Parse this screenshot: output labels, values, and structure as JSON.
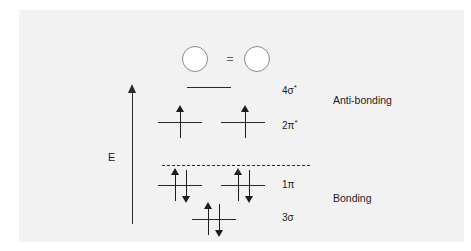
{
  "figure": {
    "background_color": "#f2f2f2",
    "page_color": "#ffffff",
    "line_color": "#2a2a2a",
    "circle_stroke_color": "#8a8a8a"
  },
  "header": {
    "equals_symbol": "=",
    "circle_left_name": "atomic-orbital-left",
    "circle_right_name": "atomic-orbital-right"
  },
  "axis": {
    "label": "E",
    "direction": "up",
    "meaning": "energy increasing upward"
  },
  "regions": [
    {
      "label": "Anti-bonding",
      "x": 333,
      "y": 94
    },
    {
      "label": "Bonding",
      "x": 333,
      "y": 192
    }
  ],
  "separator": {
    "style": "dashed",
    "meaning": "bonding / anti-bonding divide"
  },
  "chart_data": {
    "type": "diagram",
    "ylabel": "E",
    "levels": [
      {
        "label_base": "4",
        "label_greek": "σ",
        "label_star": "*",
        "label": "4σ*",
        "region": "anti-bonding",
        "electrons": 0,
        "degeneracy": 1,
        "y": 87,
        "lines": [
          {
            "x": 187,
            "width": 44
          }
        ],
        "arrows": []
      },
      {
        "label_base": "2",
        "label_greek": "π",
        "label_star": "*",
        "label": "2π*",
        "region": "anti-bonding",
        "electrons": 2,
        "degeneracy": 2,
        "y": 122,
        "lines": [
          {
            "x": 158,
            "width": 44
          },
          {
            "x": 221,
            "width": 44
          }
        ],
        "arrows": [
          {
            "x": 176,
            "top": 105,
            "height": 33,
            "dir": "up"
          },
          {
            "x": 241,
            "top": 105,
            "height": 33,
            "dir": "up"
          }
        ]
      },
      {
        "label_base": "1",
        "label_greek": "π",
        "label_star": "",
        "label": "1π",
        "region": "bonding",
        "electrons": 4,
        "degeneracy": 2,
        "y": 185,
        "lines": [
          {
            "x": 158,
            "width": 44
          },
          {
            "x": 221,
            "width": 44
          }
        ],
        "arrows": [
          {
            "x": 171,
            "top": 168,
            "height": 33,
            "dir": "up"
          },
          {
            "x": 182,
            "top": 170,
            "height": 33,
            "dir": "down"
          },
          {
            "x": 234,
            "top": 168,
            "height": 33,
            "dir": "up"
          },
          {
            "x": 245,
            "top": 170,
            "height": 33,
            "dir": "down"
          }
        ]
      },
      {
        "label_base": "3",
        "label_greek": "σ",
        "label_star": "",
        "label": "3σ",
        "region": "bonding",
        "electrons": 2,
        "degeneracy": 1,
        "y": 219,
        "lines": [
          {
            "x": 192,
            "width": 44
          }
        ],
        "arrows": [
          {
            "x": 204,
            "top": 202,
            "height": 33,
            "dir": "up"
          },
          {
            "x": 215,
            "top": 204,
            "height": 33,
            "dir": "down"
          }
        ]
      }
    ],
    "label_x": 282,
    "label_positions": [
      {
        "label": "4σ*",
        "y": 82
      },
      {
        "label": "2π*",
        "y": 117
      },
      {
        "label": "1π",
        "y": 179
      },
      {
        "label": "3σ",
        "y": 212
      }
    ]
  }
}
